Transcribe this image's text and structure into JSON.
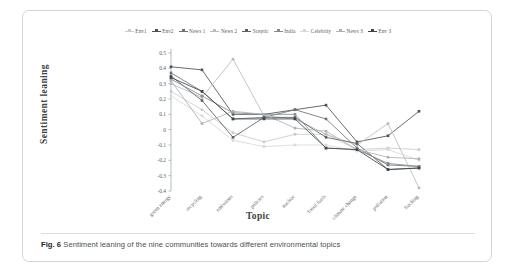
{
  "figure": {
    "label": "Fig. 6",
    "caption": "Sentiment leaning of the nine communities towards different environmental topics"
  },
  "chart_data": {
    "type": "line",
    "title": "",
    "xlabel": "Topic",
    "ylabel": "Sentiment leaning",
    "ylim": [
      -0.4,
      0.5
    ],
    "yticks": [
      "0.5",
      "0.4",
      "0.3",
      "0.2",
      "0.1",
      "0",
      "-0.1",
      "-0.2",
      "-0.3",
      "-0.4"
    ],
    "ytick_values": [
      0.5,
      0.4,
      0.3,
      0.2,
      0.1,
      0,
      -0.1,
      -0.2,
      -0.3,
      -0.4
    ],
    "grid": false,
    "legend_position": "top",
    "categories": [
      "green energy",
      "recycling",
      "emissions",
      "policies",
      "nuclear",
      "fossil fuels",
      "climate change",
      "pollution",
      "fracking"
    ],
    "series": [
      {
        "name": "Env1",
        "color": "#c9cbcd",
        "values": [
          0.25,
          0.13,
          -0.02,
          -0.08,
          -0.03,
          -0.03,
          -0.13,
          -0.12,
          -0.13
        ]
      },
      {
        "name": "Env2",
        "color": "#4c5155",
        "values": [
          0.41,
          0.39,
          0.1,
          0.1,
          0.13,
          0.16,
          -0.08,
          -0.04,
          0.12
        ]
      },
      {
        "name": "News 1",
        "color": "#6d7276",
        "values": [
          0.37,
          0.25,
          0.07,
          0.08,
          0.13,
          0.07,
          -0.12,
          -0.23,
          -0.24
        ]
      },
      {
        "name": "News 2",
        "color": "#b9bcbe",
        "values": [
          0.3,
          0.21,
          0.46,
          0.09,
          0.07,
          -0.03,
          -0.1,
          0.04,
          -0.38
        ]
      },
      {
        "name": "Sceptic",
        "color": "#5b6064",
        "values": [
          0.35,
          0.19,
          -0.05,
          0.08,
          0.08,
          -0.05,
          -0.09,
          -0.26,
          -0.25
        ]
      },
      {
        "name": "India",
        "color": "#858a8d",
        "values": [
          0.33,
          0.22,
          0.11,
          0.1,
          0.1,
          -0.12,
          -0.13,
          -0.22,
          -0.24
        ]
      },
      {
        "name": "Celebrity",
        "color": "#d6d8d9",
        "values": [
          0.22,
          0.09,
          -0.07,
          -0.11,
          -0.1,
          -0.1,
          -0.14,
          -0.13,
          -0.2
        ]
      },
      {
        "name": "News 3",
        "color": "#aeb1b4",
        "values": [
          0.32,
          0.04,
          0.12,
          0.1,
          0.01,
          -0.01,
          -0.13,
          -0.18,
          -0.19
        ]
      },
      {
        "name": "Env 3",
        "color": "#3f4447",
        "values": [
          0.34,
          0.25,
          0.07,
          0.07,
          0.07,
          -0.12,
          -0.13,
          -0.26,
          -0.25
        ]
      }
    ]
  }
}
